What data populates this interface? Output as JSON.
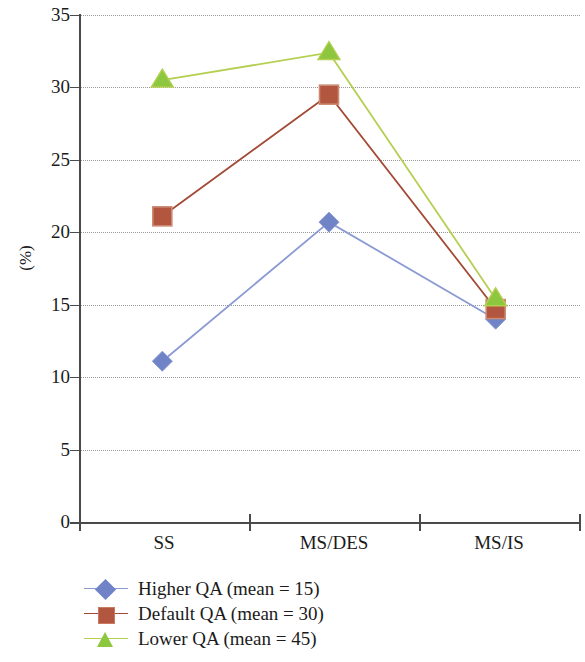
{
  "chart_data": {
    "type": "line",
    "title": "",
    "xlabel": "",
    "ylabel": "(%)",
    "categories": [
      "SS",
      "MS/DES",
      "MS/IS"
    ],
    "ylim": [
      0,
      35
    ],
    "yticks": [
      0,
      5,
      10,
      15,
      20,
      25,
      30,
      35
    ],
    "ytick_labels": [
      "0",
      "5",
      "10",
      "15",
      "20",
      "25",
      "30",
      "35"
    ],
    "grid": true,
    "grid_style": "dotted-horizontal",
    "legend_position": "bottom-left",
    "series": [
      {
        "name": "Higher QA (mean = 15)",
        "marker": "diamond",
        "color": "#6f83c6",
        "line_color": "#8c9ad4",
        "values": [
          11.1,
          20.7,
          14.0
        ]
      },
      {
        "name": "Default QA (mean = 30)",
        "marker": "square",
        "color": "#b3563f",
        "line_color": "#a34a36",
        "values": [
          21.1,
          29.5,
          14.7
        ]
      },
      {
        "name": "Lower QA (mean = 45)",
        "marker": "triangle",
        "color": "#8dc63f",
        "line_color": "#b5cf52",
        "values": [
          30.5,
          32.4,
          15.4
        ]
      }
    ]
  },
  "axis": {
    "y_label": "(%)",
    "y_tick_labels": [
      "35",
      "30",
      "25",
      "20",
      "15",
      "10",
      "5",
      "0"
    ],
    "x_tick_labels": [
      "SS",
      "MS/DES",
      "MS/IS"
    ]
  },
  "legend": {
    "items": [
      {
        "label": "Higher QA (mean = 15)",
        "marker": "diamond-marker",
        "color": "#6f83c6"
      },
      {
        "label": "Default QA (mean = 30)",
        "marker": "square-marker",
        "color": "#b3563f"
      },
      {
        "label": "Lower QA (mean = 45)",
        "marker": "triangle-marker",
        "color": "#8dc63f"
      }
    ]
  }
}
